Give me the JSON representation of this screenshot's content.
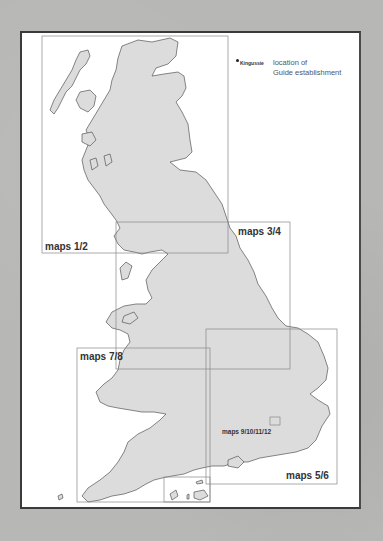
{
  "legend": {
    "marker_sample": "Kingussie",
    "description_line1": "location of",
    "description_line2": "Guide establishment"
  },
  "map_boxes": [
    {
      "id": "maps-1-2",
      "label": "maps 1/2"
    },
    {
      "id": "maps-3-4",
      "label": "maps 3/4"
    },
    {
      "id": "maps-5-6",
      "label": "maps 5/6"
    },
    {
      "id": "maps-7-8",
      "label": "maps 7/8"
    },
    {
      "id": "maps-9-12",
      "label": "maps 9/10/11/12"
    }
  ],
  "colors": {
    "background": "#b7b7b5",
    "page": "#ffffff",
    "land": "#dcdcdc",
    "coast": "#555555",
    "box_line": "#888888"
  }
}
